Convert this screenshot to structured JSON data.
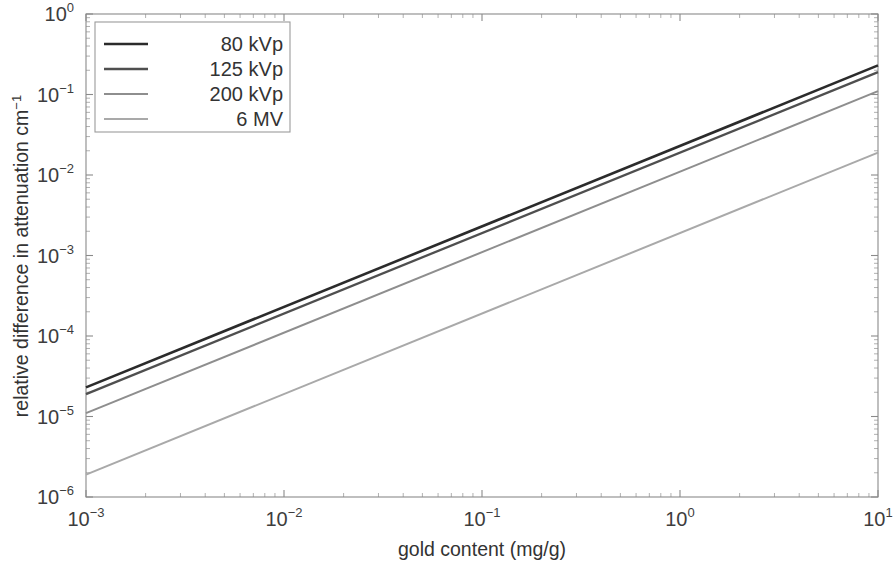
{
  "chart_data": {
    "type": "line",
    "title": "",
    "xlabel": "gold content (mg/g)",
    "ylabel": "relative difference in attenuation cm⁻¹",
    "xscale": "log",
    "yscale": "log",
    "xlim": [
      0.001,
      10
    ],
    "ylim": [
      1e-06,
      1
    ],
    "grid": false,
    "legend_position": "upper left",
    "x_tick_labels": [
      "10⁻³",
      "10⁻²",
      "10⁻¹",
      "10⁰",
      "10¹"
    ],
    "x_tick_values": [
      0.001,
      0.01,
      0.1,
      1,
      10
    ],
    "y_tick_labels": [
      "10⁰",
      "10⁻¹",
      "10⁻²",
      "10⁻³",
      "10⁻´",
      "10⁻⁵",
      "10⁻⁶"
    ],
    "y_tick_values": [
      1,
      0.1,
      0.01,
      0.001,
      0.0001,
      1e-05,
      1e-06
    ],
    "x": [
      0.001,
      10
    ],
    "series": [
      {
        "name": "80 kVp",
        "color": "#2b2b2b",
        "width": 2.6,
        "values": [
          2.3e-05,
          0.23
        ]
      },
      {
        "name": "125 kVp",
        "color": "#4f4f4f",
        "width": 2.3,
        "values": [
          1.9e-05,
          0.19
        ]
      },
      {
        "name": "200 kVp",
        "color": "#8e8e8e",
        "width": 2.0,
        "values": [
          1.1e-05,
          0.11
        ]
      },
      {
        "name": "6 MV",
        "color": "#a9a9a9",
        "width": 2.0,
        "values": [
          1.9e-06,
          0.019
        ]
      }
    ]
  },
  "legend": {
    "entries": [
      "80 kVp",
      "125 kVp",
      "200 kVp",
      "6 MV"
    ]
  },
  "axes": {
    "x_title": "gold content (mg/g)",
    "y_title_main": "relative difference in attenuation cm",
    "y_title_sup": "-1"
  }
}
